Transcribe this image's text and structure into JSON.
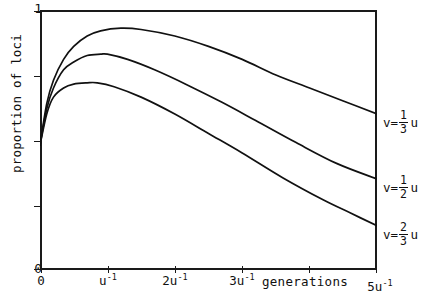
{
  "chart_data": {
    "type": "line",
    "title": "",
    "subtitle": "",
    "xlabel": "generations",
    "ylabel": "proportion of loci",
    "xlim": [
      0,
      5
    ],
    "ylim": [
      0,
      1
    ],
    "grid": false,
    "legend_position": "right-of-axes-inline",
    "x_unit": "u^-1",
    "x_tick_labels": [
      "0",
      "u⁻¹",
      "2u⁻¹",
      "3u⁻¹",
      "",
      "5u⁻¹"
    ],
    "x_tick_values": [
      0,
      1,
      2,
      3,
      4,
      5
    ],
    "y_tick_labels": [
      "0",
      "",
      "",
      "",
      "1"
    ],
    "y_tick_values": [
      0,
      0.25,
      0.5,
      0.75,
      1
    ],
    "series": [
      {
        "name": "v=1/3 u",
        "label_parts": {
          "var": "v",
          "eq": "=",
          "numerator": "1",
          "denominator": "3",
          "unit": "u"
        },
        "peak_x": 1.2,
        "peak_y": 0.93,
        "start_y": 0.48,
        "end_y": 0.6,
        "x": [
          0,
          0.1,
          0.2,
          0.35,
          0.5,
          0.7,
          0.9,
          1.2,
          1.5,
          2.0,
          2.5,
          3.0,
          3.5,
          4.0,
          4.5,
          5.0
        ],
        "values": [
          0.48,
          0.64,
          0.73,
          0.81,
          0.86,
          0.9,
          0.92,
          0.93,
          0.925,
          0.9,
          0.86,
          0.81,
          0.75,
          0.7,
          0.65,
          0.6
        ]
      },
      {
        "name": "v=1/2 u",
        "label_parts": {
          "var": "v",
          "eq": "=",
          "numerator": "1",
          "denominator": "2",
          "unit": "u"
        },
        "peak_x": 1.0,
        "peak_y": 0.83,
        "start_y": 0.48,
        "end_y": 0.35,
        "x": [
          0,
          0.1,
          0.2,
          0.35,
          0.5,
          0.7,
          0.9,
          1.0,
          1.3,
          1.7,
          2.2,
          2.7,
          3.2,
          3.8,
          4.4,
          5.0
        ],
        "values": [
          0.48,
          0.62,
          0.7,
          0.77,
          0.8,
          0.825,
          0.83,
          0.83,
          0.81,
          0.77,
          0.71,
          0.645,
          0.575,
          0.49,
          0.41,
          0.35
        ]
      },
      {
        "name": "v=2/3 u",
        "label_parts": {
          "var": "v",
          "eq": "=",
          "numerator": "2",
          "denominator": "3",
          "unit": "u"
        },
        "peak_x": 0.85,
        "peak_y": 0.72,
        "start_y": 0.48,
        "end_y": 0.17,
        "x": [
          0,
          0.1,
          0.2,
          0.35,
          0.5,
          0.7,
          0.85,
          1.1,
          1.5,
          2.0,
          2.5,
          3.0,
          3.6,
          4.2,
          4.6,
          5.0
        ],
        "values": [
          0.48,
          0.6,
          0.665,
          0.7,
          0.715,
          0.72,
          0.72,
          0.705,
          0.665,
          0.6,
          0.525,
          0.45,
          0.355,
          0.27,
          0.22,
          0.17
        ]
      }
    ],
    "colors": {
      "curve": "#111111",
      "axis": "#1a1a1a",
      "background": "#ffffff"
    }
  },
  "axes": {
    "y_top_label": "1",
    "y_bottom_label": "0",
    "y_title": "proportion of loci",
    "x_title": "generations",
    "x_labels": [
      {
        "text": "0",
        "sup": "",
        "value": 0
      },
      {
        "text": "u",
        "sup": "-1",
        "value": 1
      },
      {
        "text": "2u",
        "sup": "-1",
        "value": 2
      },
      {
        "text": "3u",
        "sup": "-1",
        "value": 3
      },
      {
        "text": "5u",
        "sup": "-1",
        "value": 5
      }
    ]
  },
  "annotations": [
    {
      "id": "ann-1",
      "var": "v",
      "eq": "=",
      "num": "1",
      "den": "3",
      "unit": "u"
    },
    {
      "id": "ann-2",
      "var": "v",
      "eq": "=",
      "num": "1",
      "den": "2",
      "unit": "u"
    },
    {
      "id": "ann-3",
      "var": "v",
      "eq": "=",
      "num": "2",
      "den": "3",
      "unit": "u"
    }
  ]
}
